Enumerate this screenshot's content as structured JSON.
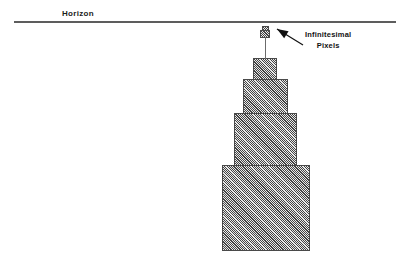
{
  "figure": {
    "background_color": "#ffffff",
    "width": 400,
    "height": 264
  },
  "horizon": {
    "label": "Horizon",
    "label_x": 62,
    "label_y": 9,
    "line_x": 14,
    "line_y": 21,
    "line_width": 382,
    "line_color": "#5d5d5d"
  },
  "annotation": {
    "text": "Infinitesimal\nPixels",
    "text_x": 305,
    "text_y": 30,
    "arrow_tip_x": 277,
    "arrow_tip_y": 29,
    "arrow_tail_x": 303,
    "arrow_tail_y": 45,
    "color": "#111111"
  },
  "mast": {
    "x": 265,
    "y": 37,
    "height": 22,
    "color": "#6b6b6b"
  },
  "tower": {
    "fill_color": "#9b9b9b",
    "edge_color": "#4a4a4a",
    "hatch": "diagonal-45",
    "blocks": [
      {
        "name": "pixel-block-5",
        "x": 262,
        "y": 26,
        "width": 7,
        "height": 6,
        "label": "tiny-top-cap"
      },
      {
        "name": "pixel-block-4",
        "x": 260,
        "y": 30,
        "width": 10,
        "height": 8,
        "label": "tiny-top-body"
      },
      {
        "name": "pixel-block-3",
        "x": 253,
        "y": 58,
        "width": 24,
        "height": 22,
        "label": "small"
      },
      {
        "name": "pixel-block-2",
        "x": 243,
        "y": 79,
        "width": 45,
        "height": 35,
        "label": "medium"
      },
      {
        "name": "pixel-block-1",
        "x": 234,
        "y": 113,
        "width": 63,
        "height": 53,
        "label": "large"
      },
      {
        "name": "pixel-block-0",
        "x": 222,
        "y": 165,
        "width": 88,
        "height": 86,
        "label": "base"
      }
    ]
  }
}
